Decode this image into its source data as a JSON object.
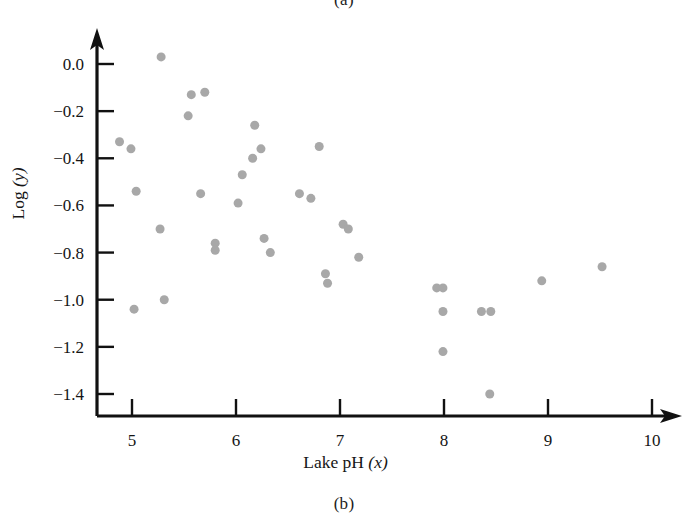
{
  "figure": {
    "caption_top": "(a)",
    "caption_bottom": "(b)"
  },
  "chart_data": {
    "type": "scatter",
    "title": "",
    "subtitle": "",
    "xlabel": "Lake pH (x)",
    "xlabel_text": "Lake pH",
    "xlabel_var": "(x)",
    "ylabel": "Log (y)",
    "ylabel_text": "Log",
    "ylabel_var": "(y)",
    "xlim": [
      4.62,
      10.3
    ],
    "ylim": [
      -1.52,
      0.13
    ],
    "xticks": [
      5,
      6,
      7,
      8,
      9,
      10
    ],
    "xticklabels": [
      "5",
      "6",
      "7",
      "8",
      "9",
      "10"
    ],
    "yticks": [
      0.0,
      -0.2,
      -0.4,
      -0.6,
      -0.8,
      -1.0,
      -1.2,
      -1.4
    ],
    "yticklabels": [
      "0.0",
      "−0.2",
      "−0.4",
      "−0.6",
      "−0.8",
      "−1.0",
      "−1.2",
      "−1.4"
    ],
    "grid": false,
    "legend": null,
    "marker_color": "#a8a8a8",
    "marker_size": 8,
    "axis_color": "#111111",
    "points": [
      {
        "x": 5.28,
        "y": 0.03
      },
      {
        "x": 5.57,
        "y": -0.13
      },
      {
        "x": 5.7,
        "y": -0.12
      },
      {
        "x": 5.54,
        "y": -0.22
      },
      {
        "x": 6.18,
        "y": -0.26
      },
      {
        "x": 4.88,
        "y": -0.33
      },
      {
        "x": 6.8,
        "y": -0.35
      },
      {
        "x": 4.99,
        "y": -0.36
      },
      {
        "x": 6.24,
        "y": -0.36
      },
      {
        "x": 6.16,
        "y": -0.4
      },
      {
        "x": 6.06,
        "y": -0.47
      },
      {
        "x": 5.04,
        "y": -0.54
      },
      {
        "x": 5.66,
        "y": -0.55
      },
      {
        "x": 6.61,
        "y": -0.55
      },
      {
        "x": 6.72,
        "y": -0.57
      },
      {
        "x": 6.02,
        "y": -0.59
      },
      {
        "x": 5.27,
        "y": -0.7
      },
      {
        "x": 7.03,
        "y": -0.68
      },
      {
        "x": 7.08,
        "y": -0.7
      },
      {
        "x": 5.8,
        "y": -0.76
      },
      {
        "x": 5.8,
        "y": -0.79
      },
      {
        "x": 6.27,
        "y": -0.74
      },
      {
        "x": 6.33,
        "y": -0.8
      },
      {
        "x": 7.18,
        "y": -0.82
      },
      {
        "x": 6.86,
        "y": -0.89
      },
      {
        "x": 6.88,
        "y": -0.93
      },
      {
        "x": 5.02,
        "y": -1.04
      },
      {
        "x": 5.31,
        "y": -1.0
      },
      {
        "x": 8.94,
        "y": -0.92
      },
      {
        "x": 9.52,
        "y": -0.86
      },
      {
        "x": 7.93,
        "y": -0.95
      },
      {
        "x": 7.99,
        "y": -0.95
      },
      {
        "x": 7.99,
        "y": -1.05
      },
      {
        "x": 8.36,
        "y": -1.05
      },
      {
        "x": 8.45,
        "y": -1.05
      },
      {
        "x": 7.99,
        "y": -1.22
      },
      {
        "x": 8.44,
        "y": -1.4
      }
    ]
  }
}
